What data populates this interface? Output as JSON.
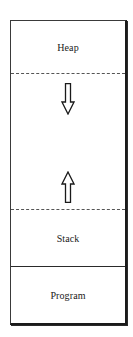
{
  "diagram": {
    "title": "",
    "regions": [
      {
        "id": "heap",
        "label": "Heap"
      },
      {
        "id": "free-space",
        "label": ""
      },
      {
        "id": "stack",
        "label": "Stack"
      },
      {
        "id": "program",
        "label": "Program"
      }
    ],
    "arrows": [
      {
        "id": "heap-growth",
        "direction": "down",
        "icon": "down-arrow-icon"
      },
      {
        "id": "stack-growth",
        "direction": "up",
        "icon": "up-arrow-icon"
      }
    ],
    "dividers": [
      {
        "between": [
          "heap",
          "free-space"
        ],
        "style": "dashed"
      },
      {
        "between": [
          "free-space",
          "stack"
        ],
        "style": "dashed"
      },
      {
        "between": [
          "stack",
          "program"
        ],
        "style": "solid"
      }
    ],
    "colors": {
      "line": "#1a1a1a",
      "background": "#ffffff",
      "text": "#1a1a1a"
    }
  }
}
